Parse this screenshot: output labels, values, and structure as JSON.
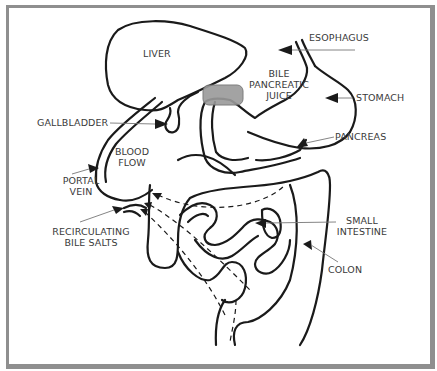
{
  "diagram": {
    "labels": {
      "liver": "LIVER",
      "esophagus": "ESOPHAGUS",
      "bile_juice_1": "BILE",
      "bile_juice_2": "PANCREATIC",
      "bile_juice_3": "JUICE",
      "stomach": "STOMACH",
      "gallbladder": "GALLBLADDER",
      "pancreas": "PANCREAS",
      "blood_flow_1": "BLOOD",
      "blood_flow_2": "FLOW",
      "portal_vein_1": "PORTAL",
      "portal_vein_2": "VEIN",
      "recirc_1": "RECIRCULATING",
      "recirc_2": "BILE SALTS",
      "small_intestine_1": "SMALL",
      "small_intestine_2": "INTESTINE",
      "colon": "COLON"
    },
    "colors": {
      "border": "#8f8f8f",
      "outline": "#1a1a1a",
      "duodenum_highlight": "#9a9a9a",
      "label_text": "#3a3a3a",
      "leader_line": "#777777"
    }
  }
}
